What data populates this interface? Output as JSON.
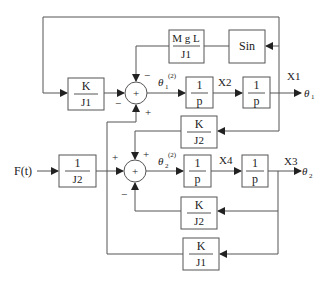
{
  "diagram": {
    "type": "block-diagram",
    "blocks": {
      "k_j1_top": {
        "num": "K",
        "den": "J1"
      },
      "mgl_j1": {
        "num": "M g L",
        "den": "J1"
      },
      "sin": {
        "label": "Sin"
      },
      "int1": {
        "num": "1",
        "den": "p"
      },
      "int2": {
        "num": "1",
        "den": "p"
      },
      "k_j2_top": {
        "num": "K",
        "den": "J2"
      },
      "one_j2": {
        "num": "1",
        "den": "J2"
      },
      "int3": {
        "num": "1",
        "den": "p"
      },
      "int4": {
        "num": "1",
        "den": "p"
      },
      "k_j2_bottom": {
        "num": "K",
        "den": "J2"
      },
      "k_j1_bottom": {
        "num": "K",
        "den": "J1"
      }
    },
    "summers": {
      "sum1": {
        "symbol": "+",
        "signs": {
          "left": "−",
          "top": "−",
          "bottom": "+"
        }
      },
      "sum2": {
        "symbol": "+",
        "signs": {
          "left": "+",
          "top": "+",
          "bottom": "−"
        }
      }
    },
    "signals": {
      "theta1_dd": {
        "base": "θ",
        "sub": "1",
        "sup": "(2)"
      },
      "theta2_dd": {
        "base": "θ",
        "sub": "2",
        "sup": "(2)"
      },
      "x2": "X2",
      "x1": "X1",
      "x4": "X4",
      "x3": "X3",
      "theta1_out": {
        "base": "θ",
        "sub": "1"
      },
      "theta2_out": {
        "base": "θ",
        "sub": "2"
      },
      "input": "F(t)"
    }
  }
}
